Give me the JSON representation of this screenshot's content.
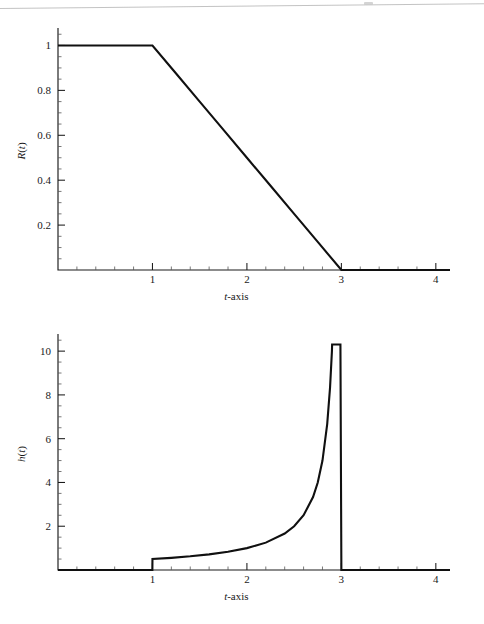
{
  "figure": {
    "background_color": "#ffffff",
    "ink_color": "#101010",
    "rule_color": "#b9b9b9"
  },
  "panels": [
    {
      "id": "reliability",
      "y_axis_label": "R(t)",
      "y_axis_label_parts": {
        "symbol": "R",
        "arg": "t"
      },
      "x_axis_label": "t-axis",
      "x_axis_label_parts": {
        "symbol": "t",
        "suffix": "-axis"
      },
      "x_ticks": [
        "1",
        "2",
        "3",
        "4"
      ],
      "y_ticks": [
        "0.2",
        "0.4",
        "0.6",
        "0.8",
        "1"
      ]
    },
    {
      "id": "hazard",
      "y_axis_label": "h(t)",
      "y_axis_label_parts": {
        "symbol": "h",
        "arg": "t"
      },
      "x_axis_label": "t-axis",
      "x_axis_label_parts": {
        "symbol": "t",
        "suffix": "-axis"
      },
      "x_ticks": [
        "1",
        "2",
        "3",
        "4"
      ],
      "y_ticks": [
        "2",
        "4",
        "6",
        "8",
        "10"
      ]
    }
  ],
  "chart_data": [
    {
      "type": "line",
      "id": "reliability",
      "title": "",
      "xlabel": "t-axis",
      "ylabel": "R(t)",
      "xlim": [
        0,
        4.15
      ],
      "ylim": [
        0,
        1.06
      ],
      "xticks": [
        1,
        2,
        3,
        4
      ],
      "xticklabels": [
        "1",
        "2",
        "3",
        "4"
      ],
      "yticks": [
        0.2,
        0.4,
        0.6,
        0.8,
        1
      ],
      "yticklabels": [
        "0.2",
        "0.4",
        "0.6",
        "0.8",
        "1"
      ],
      "x_minor_tick_step": 0.2,
      "y_minor_tick_step": 0.05,
      "grid": false,
      "legend": null,
      "series": [
        {
          "name": "R(t)",
          "description": "Trapezoidal reliability: flat at 1 until t=1, linear decrease to 0 at t=3, zero thereafter",
          "x": [
            0,
            0.5,
            1,
            1.25,
            1.5,
            1.75,
            2,
            2.25,
            2.5,
            2.75,
            3,
            3.5,
            4.15
          ],
          "y": [
            1,
            1,
            1,
            0.875,
            0.75,
            0.625,
            0.5,
            0.375,
            0.25,
            0.125,
            0,
            0,
            0
          ]
        }
      ]
    },
    {
      "type": "line",
      "id": "hazard",
      "title": "",
      "xlabel": "t-axis",
      "ylabel": "h(t)",
      "xlim": [
        0,
        4.15
      ],
      "ylim": [
        0,
        10.6
      ],
      "xticks": [
        1,
        2,
        3,
        4
      ],
      "xticklabels": [
        "1",
        "2",
        "3",
        "4"
      ],
      "yticks": [
        2,
        4,
        6,
        8,
        10
      ],
      "yticklabels": [
        "2",
        "4",
        "6",
        "8",
        "10"
      ],
      "x_minor_tick_step": 0.2,
      "y_minor_tick_step": 0.5,
      "grid": false,
      "legend": null,
      "series": [
        {
          "name": "h(t)",
          "description": "Hazard rate: 0 for t<1, jumps to 0.5 at t=1, h(t)=1/(3-t) rising to a vertical asymptote at t=3, then drops to 0 for t>3",
          "x": [
            0,
            0.999,
            1,
            1.2,
            1.4,
            1.6,
            1.8,
            2.0,
            2.2,
            2.4,
            2.5,
            2.6,
            2.7,
            2.75,
            2.8,
            2.85,
            2.88,
            2.9,
            2.902,
            2.99,
            3.0,
            3.5,
            4.15
          ],
          "y": [
            0,
            0,
            0.5,
            0.556,
            0.625,
            0.714,
            0.833,
            1.0,
            1.25,
            1.667,
            2.0,
            2.5,
            3.333,
            4.0,
            5.0,
            6.667,
            8.333,
            10.0,
            10.3,
            10.3,
            0,
            0,
            0
          ]
        }
      ]
    }
  ]
}
